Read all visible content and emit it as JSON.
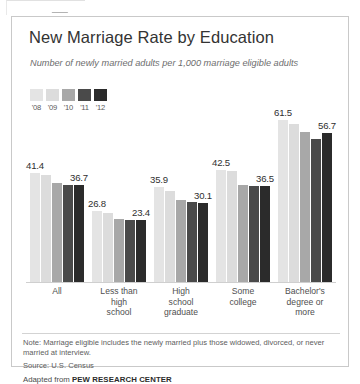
{
  "chart_data": {
    "type": "bar",
    "title": "New Marriage Rate by Education",
    "subtitle": "Number of newly married adults per 1,000 marriage eligible adults",
    "xlabel": "",
    "ylabel": "",
    "ylim": [
      0,
      61.5
    ],
    "grid": false,
    "legend_position": "top-left",
    "categories": [
      "All",
      "Less than high school",
      "High school graduate",
      "Some college",
      "Bachelor's degree or more"
    ],
    "category_lines": [
      [
        "All"
      ],
      [
        "Less than",
        "high",
        "school"
      ],
      [
        "High",
        "school",
        "graduate"
      ],
      [
        "Some",
        "college"
      ],
      [
        "Bachelor's",
        "degree or",
        "more"
      ]
    ],
    "series": [
      {
        "name": "'08",
        "color": "#e4e4e4",
        "values": [
          41.4,
          26.8,
          35.9,
          42.5,
          61.5
        ]
      },
      {
        "name": "'09",
        "color": "#dcdcdc",
        "values": [
          40.6,
          26.3,
          34.6,
          42.1,
          59.8
        ]
      },
      {
        "name": "'10",
        "color": "#a8a8a8",
        "values": [
          37.6,
          24.1,
          31.2,
          37.0,
          56.9
        ]
      },
      {
        "name": "'11",
        "color": "#4a4a4a",
        "values": [
          36.9,
          23.5,
          30.3,
          36.6,
          54.4
        ]
      },
      {
        "name": "'12",
        "color": "#2b2b2b",
        "values": [
          36.7,
          23.4,
          30.1,
          36.5,
          56.7
        ]
      }
    ],
    "value_labels": [
      {
        "group": 0,
        "series": 0,
        "text": "41.4"
      },
      {
        "group": 0,
        "series": 4,
        "text": "36.7"
      },
      {
        "group": 1,
        "series": 0,
        "text": "26.8"
      },
      {
        "group": 1,
        "series": 4,
        "text": "23.4"
      },
      {
        "group": 2,
        "series": 0,
        "text": "35.9"
      },
      {
        "group": 2,
        "series": 4,
        "text": "30.1"
      },
      {
        "group": 3,
        "series": 0,
        "text": "42.5"
      },
      {
        "group": 3,
        "series": 4,
        "text": "36.5"
      },
      {
        "group": 4,
        "series": 0,
        "text": "61.5"
      },
      {
        "group": 4,
        "series": 4,
        "text": "56.7"
      }
    ]
  },
  "footer": {
    "note": "Note: Marriage eligible includes the newly married plus those widowed, divorced, or never married at interview.",
    "source": "Source: U.S. Census",
    "adapted_prefix": "Adapted from ",
    "adapted_brand": "PEW RESEARCH CENTER"
  }
}
